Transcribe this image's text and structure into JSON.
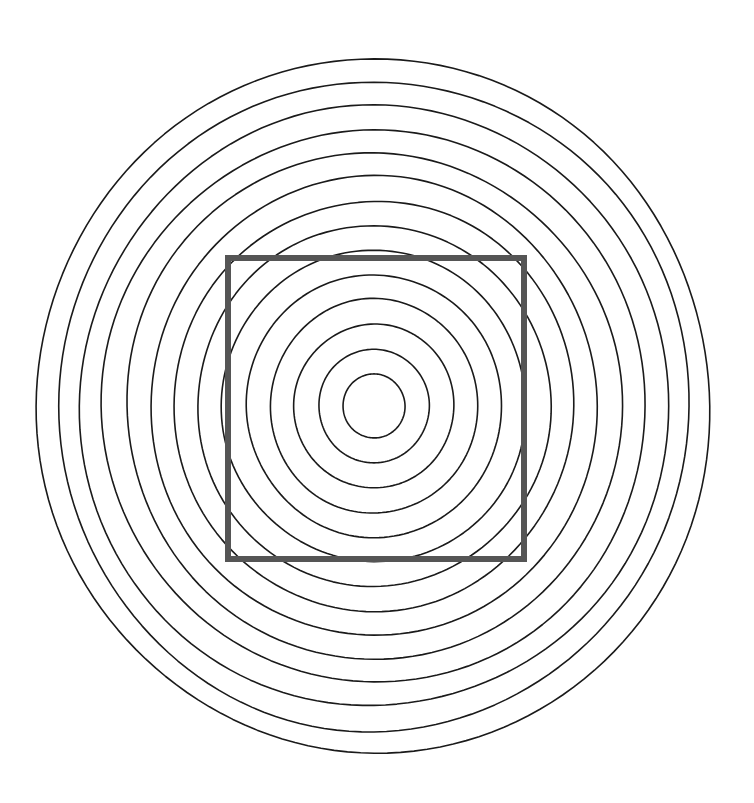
{
  "canvas": {
    "width": 754,
    "height": 803,
    "background_color": "#ffffff",
    "title": "Concentric ellipses with overlaid gray square"
  },
  "figure": {
    "center": {
      "x": 374,
      "y": 406
    }
  },
  "chart_data": {
    "type": "scatter",
    "title": "Concentric ellipses with overlaid gray square",
    "xlabel": "",
    "ylabel": "",
    "xlim": [
      0,
      754
    ],
    "ylim": [
      0,
      803
    ],
    "grid": false,
    "legend": "none",
    "shapes": {
      "concentric_circles": {
        "shape": "ellipse",
        "count": 14,
        "center_x": 374,
        "center_y": 406,
        "stroke_color": "#1a1a1a",
        "stroke_width": 1.6,
        "fill": "none",
        "radii_x": [
          31,
          55,
          80,
          104,
          128,
          152,
          176,
          200,
          224,
          248,
          271,
          294,
          316,
          338
        ],
        "radii_y": [
          32,
          57,
          82,
          107,
          131,
          156,
          181,
          205,
          229,
          253,
          277,
          301,
          324,
          346
        ]
      },
      "square": {
        "shape": "rectangle",
        "x": 225,
        "y": 255,
        "width": 302,
        "height": 307,
        "stroke_color": "#555555",
        "stroke_width": 6,
        "fill": "none"
      }
    }
  }
}
